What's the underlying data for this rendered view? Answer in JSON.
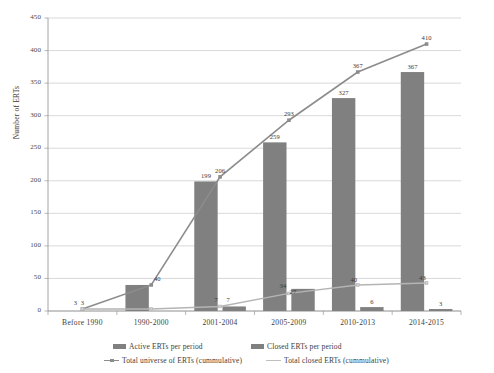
{
  "chart_data": {
    "type": "bar",
    "title": "",
    "xlabel": "",
    "ylabel": "Number of ERTs",
    "ylim": [
      0,
      450
    ],
    "ytick_step": 50,
    "yticks": [
      "0",
      "50",
      "100",
      "150",
      "200",
      "250",
      "300",
      "350",
      "400",
      "450"
    ],
    "grid": true,
    "legend_position": "bottom",
    "categories": [
      "Before 1990",
      "1990-2000",
      "2001-2004",
      "2005-2009",
      "2010-2013",
      "2014-2015"
    ],
    "series": [
      {
        "name": "Active ERTs per period",
        "type": "bar",
        "color": "#808080",
        "values": [
          0,
          40,
          199,
          259,
          327,
          367
        ],
        "labels": [
          "",
          "",
          "199",
          "259",
          "327",
          "367"
        ]
      },
      {
        "name": "Closed ERTs per period",
        "type": "bar",
        "color": "#808080",
        "values": [
          0,
          0,
          7,
          34,
          6,
          3
        ],
        "labels": [
          "",
          "",
          "",
          "",
          "6",
          "3"
        ]
      },
      {
        "name": "Total universe of ERTs (cummulative)",
        "type": "line",
        "color": "#8c8c8c",
        "values": [
          3,
          40,
          206,
          293,
          367,
          410
        ],
        "labels": [
          "3",
          "40",
          "206",
          "293",
          "367",
          "410"
        ]
      },
      {
        "name": "Total closed ERTs (cummulative)",
        "type": "line",
        "color": "#b4b4b4",
        "values": [
          3,
          3,
          7,
          27,
          40,
          43
        ],
        "labels": [
          "3",
          "",
          "7",
          "27",
          "40",
          "43"
        ]
      }
    ],
    "annotations": {
      "group1": [
        "3",
        "3"
      ],
      "group2": [
        "40",
        "40"
      ],
      "group3_closed_bar": "7",
      "group4_line": "34"
    }
  },
  "legend": {
    "items": [
      {
        "label": "Active ERTs per period",
        "marker": "bar-swatch-icon",
        "color": "#808080"
      },
      {
        "label": "Closed ERTs per period",
        "marker": "bar-swatch-icon",
        "color": "#808080"
      },
      {
        "label": "Total universe of ERTs (cummulative)",
        "marker": "line-marker-icon",
        "color": "#8c8c8c"
      },
      {
        "label": "Total closed ERTs (cummulative)",
        "marker": "line-icon",
        "color": "#b4b4b4"
      }
    ]
  }
}
